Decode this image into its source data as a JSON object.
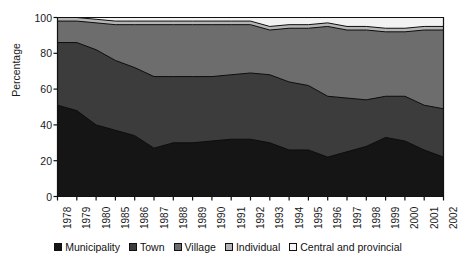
{
  "chart_data": {
    "type": "area",
    "stacked": true,
    "title": "",
    "xlabel": "",
    "ylabel": "Percentage",
    "ylim": [
      0,
      100
    ],
    "yticks": [
      0,
      20,
      40,
      60,
      80,
      100
    ],
    "grid": false,
    "legend_position": "bottom",
    "categories": [
      "1978",
      "1979",
      "1980",
      "1985",
      "1986",
      "1987",
      "1988",
      "1989",
      "1990",
      "1991",
      "1992",
      "1993",
      "1994",
      "1995",
      "1996",
      "1997",
      "1998",
      "1999",
      "2000",
      "2001",
      "2002"
    ],
    "series": [
      {
        "name": "Municipality",
        "color": "#151515",
        "values": [
          51,
          48,
          40,
          37,
          34,
          27,
          30,
          30,
          31,
          32,
          32,
          30,
          26,
          26,
          22,
          25,
          28,
          33,
          31,
          26,
          22
        ]
      },
      {
        "name": "Town",
        "color": "#3c3c3c",
        "values": [
          35,
          38,
          42,
          39,
          38,
          40,
          37,
          37,
          36,
          36,
          37,
          38,
          38,
          36,
          34,
          30,
          26,
          23,
          25,
          25,
          27
        ]
      },
      {
        "name": "Village",
        "color": "#6d6d6d",
        "values": [
          12,
          12,
          15,
          20,
          24,
          29,
          29,
          29,
          29,
          28,
          27,
          25,
          30,
          32,
          39,
          38,
          39,
          36,
          36,
          42,
          44
        ]
      },
      {
        "name": "Individual",
        "color": "#b4b4b4",
        "values": [
          2,
          2,
          2,
          2,
          2,
          2,
          2,
          2,
          2,
          2,
          2,
          2,
          2,
          2,
          2,
          2,
          2,
          2,
          2,
          2,
          2
        ]
      },
      {
        "name": "Central and provincial",
        "color": "#f2f2f2",
        "values": [
          0,
          0,
          1,
          2,
          2,
          2,
          2,
          2,
          2,
          2,
          2,
          5,
          4,
          4,
          3,
          5,
          5,
          6,
          6,
          5,
          5
        ]
      }
    ],
    "cumulative_tops": {
      "Municipality": [
        51,
        48,
        40,
        37,
        34,
        27,
        30,
        30,
        31,
        32,
        32,
        30,
        26,
        26,
        22,
        25,
        28,
        33,
        31,
        26,
        22
      ],
      "Town": [
        86,
        86,
        82,
        76,
        72,
        67,
        67,
        67,
        67,
        68,
        69,
        68,
        64,
        62,
        56,
        55,
        54,
        56,
        56,
        51,
        49
      ],
      "Village": [
        98,
        98,
        97,
        96,
        96,
        96,
        96,
        96,
        96,
        96,
        96,
        93,
        94,
        94,
        95,
        93,
        93,
        92,
        92,
        93,
        93
      ],
      "Individual": [
        100,
        100,
        99,
        98,
        98,
        98,
        98,
        98,
        98,
        98,
        98,
        95,
        96,
        96,
        97,
        95,
        95,
        94,
        94,
        95,
        95
      ],
      "Central and provincial": [
        100,
        100,
        100,
        100,
        100,
        100,
        100,
        100,
        100,
        100,
        100,
        100,
        100,
        100,
        100,
        100,
        100,
        100,
        100,
        100,
        100
      ]
    }
  },
  "axes": {
    "ylabel": "Percentage",
    "ytick_labels": [
      "0",
      "20",
      "40",
      "60",
      "80",
      "100"
    ],
    "xtick_labels": [
      "1978",
      "1979",
      "1980",
      "1985",
      "1986",
      "1987",
      "1988",
      "1989",
      "1990",
      "1991",
      "1992",
      "1993",
      "1994",
      "1995",
      "1996",
      "1997",
      "1998",
      "1999",
      "2000",
      "2001",
      "2002"
    ]
  },
  "legend": {
    "items": [
      {
        "label": "Municipality",
        "color": "#151515"
      },
      {
        "label": "Town",
        "color": "#3c3c3c"
      },
      {
        "label": "Village",
        "color": "#6d6d6d"
      },
      {
        "label": "Individual",
        "color": "#b4b4b4"
      },
      {
        "label": "Central and provincial",
        "color": "#f6f6f6"
      }
    ]
  }
}
